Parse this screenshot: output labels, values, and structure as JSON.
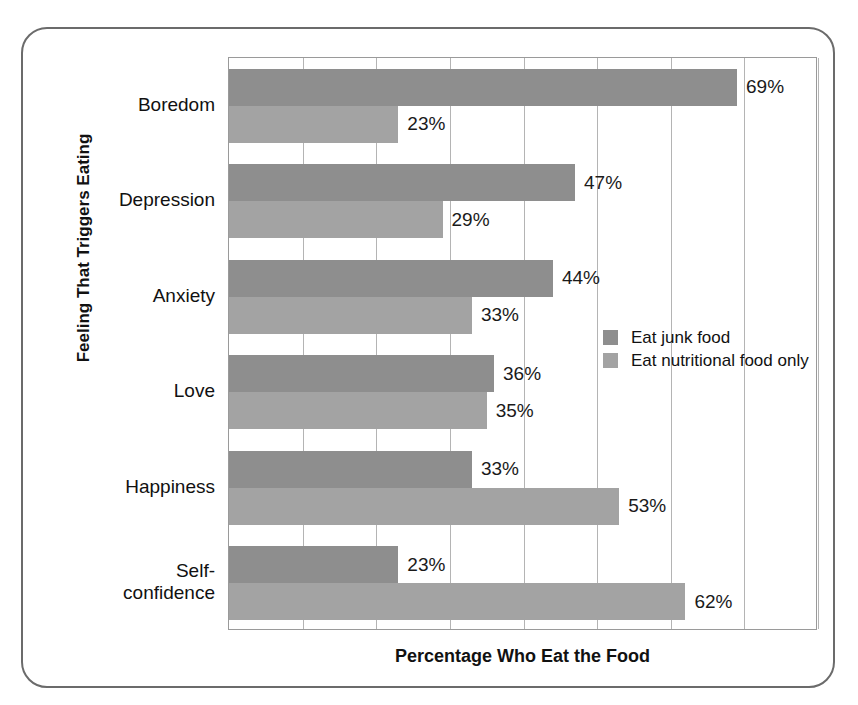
{
  "top_sliver_text": "",
  "figure": {
    "frame": "rounded-rectangle-border"
  },
  "legend": {
    "position": "inside-right-middle",
    "entries": [
      {
        "label": "Eat junk food",
        "color": "#8e8e8e"
      },
      {
        "label": "Eat nutritional food only",
        "color": "#a3a3a3"
      }
    ]
  },
  "chart_data": {
    "type": "bar",
    "orientation": "horizontal",
    "title": "",
    "xlabel": "Percentage Who Eat the Food",
    "ylabel": "Feeling That Triggers Eating",
    "xlim": [
      0,
      80
    ],
    "xticks": [
      0,
      10,
      20,
      30,
      40,
      50,
      60,
      70,
      80
    ],
    "xtick_labels": [
      "",
      "",
      "",
      "",
      "",
      "",
      "",
      "",
      ""
    ],
    "grid": true,
    "grid_axis": "x",
    "categories": [
      "Boredom",
      "Depression",
      "Anxiety",
      "Love",
      "Happiness",
      "Self-\nconfidence"
    ],
    "series": [
      {
        "name": "Eat junk food",
        "color": "#8e8e8e",
        "values": [
          69,
          47,
          44,
          36,
          33,
          23
        ],
        "labels": [
          "69%",
          "47%",
          "44%",
          "36%",
          "33%",
          "23%"
        ]
      },
      {
        "name": "Eat nutritional food only",
        "color": "#a3a3a3",
        "values": [
          23,
          29,
          33,
          35,
          53,
          62
        ],
        "labels": [
          "23%",
          "29%",
          "33%",
          "35%",
          "53%",
          "62%"
        ]
      }
    ]
  }
}
